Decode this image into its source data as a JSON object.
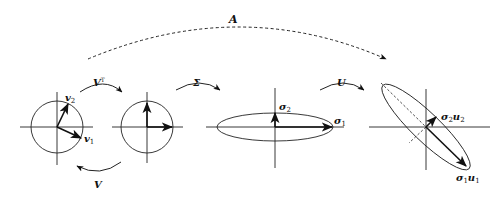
{
  "diagram": {
    "colors": {
      "stroke": "#222222",
      "background": "#ffffff"
    },
    "arrows": {
      "A": {
        "label": "A"
      },
      "VT": {
        "label": "V",
        "sup": "T"
      },
      "V": {
        "label": "V"
      },
      "Sigma": {
        "label": "Σ"
      },
      "U": {
        "label": "U"
      }
    },
    "panels": [
      {
        "id": "input",
        "shape": "circle",
        "vectors": [
          {
            "label": "v",
            "sub": "2"
          },
          {
            "label": "v",
            "sub": "1"
          }
        ]
      },
      {
        "id": "rotated",
        "shape": "circle",
        "vectors": []
      },
      {
        "id": "scaled",
        "shape": "ellipse",
        "vectors": [
          {
            "label": "σ",
            "sub": "2"
          },
          {
            "label": "σ",
            "sub": "1"
          }
        ]
      },
      {
        "id": "output",
        "shape": "rotated-ellipse",
        "vectors": [
          {
            "label": "σ",
            "sub": "2",
            "vec": "u",
            "vsub": "2"
          },
          {
            "label": "σ",
            "sub": "1",
            "vec": "u",
            "vsub": "1"
          }
        ]
      }
    ]
  }
}
